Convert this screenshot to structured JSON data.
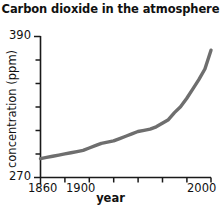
{
  "chart_data": {
    "type": "line",
    "title": "Carbon dioxide in the atmosphere",
    "xlabel": "year",
    "ylabel": "concentration (ppm)",
    "xlim": [
      1860,
      2000
    ],
    "ylim": [
      270,
      390
    ],
    "grid": false,
    "legend": "none",
    "line_color": "#6e6e6e",
    "axis_color": "#1a1a1a",
    "y_ticks": [
      270,
      290,
      310,
      330,
      350,
      370,
      390
    ],
    "y_tick_labels": [
      "270",
      "",
      "",
      "",
      "",
      "",
      "390"
    ],
    "x_ticks": [
      1860,
      1880,
      1900,
      1920,
      1940,
      1960,
      1980,
      2000
    ],
    "x_tick_labels": [
      "1860",
      "",
      "1900",
      "",
      "",
      "",
      "",
      "2000"
    ],
    "series": [
      {
        "name": "CO2 concentration",
        "x": [
          1860,
          1865,
          1870,
          1875,
          1880,
          1885,
          1890,
          1895,
          1900,
          1905,
          1910,
          1915,
          1920,
          1925,
          1930,
          1935,
          1940,
          1945,
          1950,
          1955,
          1960,
          1965,
          1970,
          1975,
          1980,
          1985,
          1990,
          1995,
          2000
        ],
        "values": [
          286,
          287,
          288,
          289,
          290,
          291,
          292,
          293,
          295,
          297,
          299,
          300,
          301,
          303,
          305,
          307,
          309,
          310,
          311,
          313,
          316,
          319,
          325,
          330,
          337,
          345,
          353,
          362,
          378
        ]
      }
    ]
  }
}
